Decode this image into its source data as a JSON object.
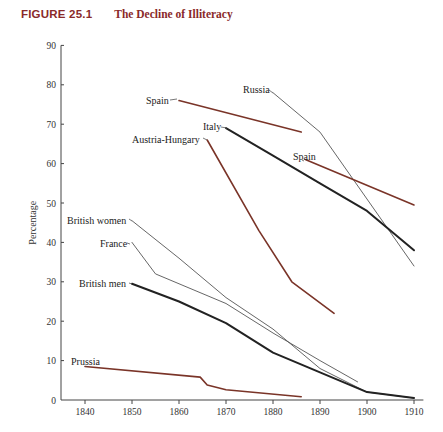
{
  "figure": {
    "number": "FIGURE 25.1",
    "title": "The Decline of Illiteracy"
  },
  "chart_data": {
    "type": "line",
    "title": "The Decline of Illiteracy",
    "xlabel": "",
    "ylabel": "Percentage",
    "xlim": [
      1835,
      1912
    ],
    "ylim": [
      0,
      90
    ],
    "x_ticks": [
      1840,
      1850,
      1860,
      1870,
      1880,
      1890,
      1900,
      1910
    ],
    "y_ticks": [
      0,
      10,
      20,
      30,
      40,
      50,
      60,
      70,
      80,
      90
    ],
    "grid": false,
    "legend": "inline labels at line starts",
    "series": [
      {
        "name": "Russia",
        "color": "#555555",
        "width": 0.9,
        "label_pos": [
          243,
          93
        ],
        "leader": [
          [
            269,
            90
          ],
          [
            273,
            93
          ]
        ],
        "points": [
          [
            1880,
            78
          ],
          [
            1890,
            68
          ],
          [
            1910,
            34
          ]
        ]
      },
      {
        "name": "Spain",
        "color": "#7a3428",
        "width": 1.6,
        "label_pos": [
          146,
          104
        ],
        "leader": [
          [
            170,
            100
          ],
          [
            177,
            99
          ]
        ],
        "points": [
          [
            1860,
            76
          ],
          [
            1886,
            68
          ]
        ]
      },
      {
        "name": "Italy",
        "color": "#222222",
        "width": 2.0,
        "label_pos": [
          203,
          130
        ],
        "leader": [
          [
            221,
            127
          ],
          [
            227,
            128
          ]
        ],
        "points": [
          [
            1870,
            69
          ],
          [
            1880,
            62
          ],
          [
            1890,
            55
          ],
          [
            1900,
            48
          ],
          [
            1910,
            38
          ]
        ]
      },
      {
        "name": "Austria-Hungary",
        "color": "#7a3428",
        "width": 1.6,
        "label_pos": [
          132,
          143
        ],
        "leader": [
          [
            203,
            138
          ],
          [
            207,
            140
          ]
        ],
        "points": [
          [
            1866,
            66
          ],
          [
            1877,
            43
          ],
          [
            1884,
            30
          ],
          [
            1893,
            22
          ]
        ]
      },
      {
        "name": "Spain",
        "color": "#7a3428",
        "width": 1.6,
        "label_pos": [
          293,
          160
        ],
        "leader": [
          [
            302,
            160
          ],
          [
            304,
            161
          ]
        ],
        "points": [
          [
            1887,
            61
          ],
          [
            1910,
            49.5
          ]
        ]
      },
      {
        "name": "British women",
        "color": "#555555",
        "width": 0.9,
        "label_pos": [
          67,
          224
        ],
        "leader": [
          [
            129,
            219
          ],
          [
            132,
            221
          ]
        ],
        "points": [
          [
            1850,
            45.5
          ],
          [
            1860,
            36
          ],
          [
            1870,
            26
          ],
          [
            1880,
            18
          ],
          [
            1890,
            8
          ],
          [
            1900,
            2
          ],
          [
            1910,
            0.5
          ]
        ]
      },
      {
        "name": "France",
        "color": "#555555",
        "width": 0.9,
        "label_pos": [
          100,
          247
        ],
        "leader": [
          [
            127,
            243
          ],
          [
            130,
            244
          ]
        ],
        "points": [
          [
            1850,
            40
          ],
          [
            1855,
            32
          ],
          [
            1870,
            24.5
          ],
          [
            1880,
            17
          ],
          [
            1890,
            10
          ],
          [
            1898,
            4.6
          ]
        ]
      },
      {
        "name": "British men",
        "color": "#222222",
        "width": 2.0,
        "label_pos": [
          79,
          287
        ],
        "leader": [
          [
            129,
            283
          ],
          [
            132,
            284
          ]
        ],
        "points": [
          [
            1850,
            29.5
          ],
          [
            1860,
            25
          ],
          [
            1870,
            19.5
          ],
          [
            1880,
            12
          ],
          [
            1890,
            7
          ],
          [
            1900,
            2
          ],
          [
            1910,
            0.5
          ]
        ]
      },
      {
        "name": "Prussia",
        "color": "#7a3428",
        "width": 1.6,
        "label_pos": [
          71,
          365
        ],
        "leader": [
          [
            86,
            366
          ],
          [
            86,
            367
          ]
        ],
        "points": [
          [
            1840,
            8.5
          ],
          [
            1864.5,
            5.8
          ],
          [
            1866,
            3.8
          ],
          [
            1870,
            2.6
          ],
          [
            1886,
            0.8
          ]
        ]
      }
    ]
  }
}
